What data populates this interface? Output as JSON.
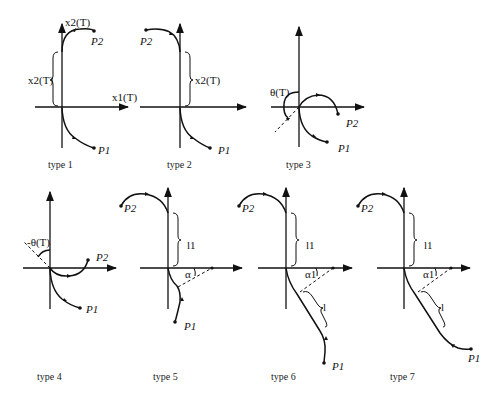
{
  "figure": {
    "panels": [
      {
        "id": "type1",
        "caption": "type 1",
        "labels": {
          "x_axis": "x1(T)",
          "y_axis": "x2(T)",
          "brace": "x2(T)",
          "p1": "P1",
          "p2": "P2"
        }
      },
      {
        "id": "type2",
        "caption": "type 2",
        "labels": {
          "brace": "x2(T)",
          "p1": "P1",
          "p2": "P2"
        }
      },
      {
        "id": "type3",
        "caption": "type 3",
        "labels": {
          "angle": "θ(T)",
          "p1": "P1",
          "p2": "P2"
        }
      },
      {
        "id": "type4",
        "caption": "type 4",
        "labels": {
          "angle": "-θ(T)",
          "p1": "P1",
          "p2": "P2"
        }
      },
      {
        "id": "type5",
        "caption": "type 5",
        "labels": {
          "brace": "l1",
          "angle": "α",
          "p1": "P1",
          "p2": "P2"
        }
      },
      {
        "id": "type6",
        "caption": "type 6",
        "labels": {
          "brace": "l1",
          "angle": "α1",
          "brace2": "l",
          "p1": "P1",
          "p2": "P2"
        }
      },
      {
        "id": "type7",
        "caption": "type 7",
        "labels": {
          "brace": "l1",
          "angle": "α1",
          "brace2": "l",
          "p1": "P1",
          "p2": "P2"
        }
      }
    ]
  }
}
